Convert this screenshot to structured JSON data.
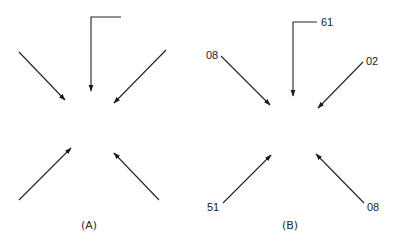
{
  "figure": {
    "panels": [
      {
        "id": "A",
        "caption": "(A)",
        "arrows": [
          {
            "position": "top",
            "shape": "L-bend",
            "label": ""
          },
          {
            "position": "upper-left",
            "label": ""
          },
          {
            "position": "upper-right",
            "label": ""
          },
          {
            "position": "lower-left",
            "label": ""
          },
          {
            "position": "lower-right",
            "label": ""
          }
        ]
      },
      {
        "id": "B",
        "caption": "(B)",
        "arrows": [
          {
            "position": "top",
            "shape": "L-bend",
            "label": "61"
          },
          {
            "position": "upper-left",
            "label": "08"
          },
          {
            "position": "upper-right",
            "label": "02"
          },
          {
            "position": "lower-left",
            "label": "51"
          },
          {
            "position": "lower-right",
            "label": "08"
          }
        ]
      }
    ],
    "colors": {
      "line": "#222222",
      "background": "#ffffff"
    }
  }
}
